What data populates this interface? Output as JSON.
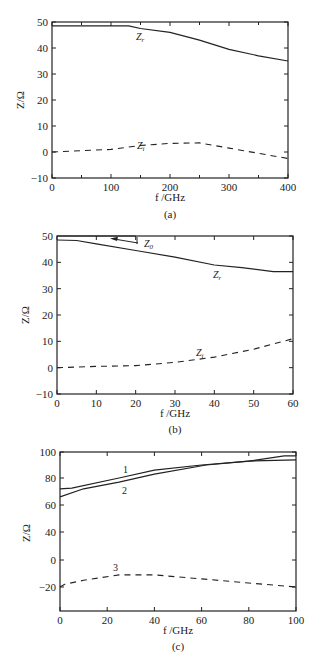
{
  "chart_data": [
    {
      "id": "a",
      "type": "line",
      "caption": "(a)",
      "title": "",
      "xlabel": "f /GHz",
      "ylabel": "Z/Ω",
      "xlim": [
        0,
        400
      ],
      "ylim": [
        -10,
        50
      ],
      "xticks": [
        0,
        100,
        200,
        300,
        400
      ],
      "yticks": [
        -10,
        0,
        10,
        20,
        30,
        40,
        50
      ],
      "xtick_labels": [
        "0",
        "100",
        "200",
        "300",
        "400"
      ],
      "ytick_labels": [
        "−10",
        "0",
        "10",
        "20",
        "30",
        "40",
        "50"
      ],
      "grid": false,
      "series": [
        {
          "name": "Zr",
          "label": "Zr",
          "style": "solid",
          "x": [
            0,
            50,
            100,
            130,
            150,
            200,
            250,
            300,
            350,
            400
          ],
          "y": [
            48.5,
            48.5,
            48.5,
            48.5,
            47.5,
            46,
            43,
            39.5,
            37,
            35
          ]
        },
        {
          "name": "Zi",
          "label": "Zi",
          "style": "dashed",
          "x": [
            0,
            50,
            100,
            150,
            200,
            250,
            300,
            350,
            400
          ],
          "y": [
            0,
            0.5,
            1,
            2.5,
            3.3,
            3.5,
            1.5,
            -0.5,
            -2.5
          ]
        }
      ]
    },
    {
      "id": "b",
      "type": "line",
      "caption": "(b)",
      "title": "",
      "xlabel": "f /GHz",
      "ylabel": "Z/Ω",
      "xlim": [
        0,
        60
      ],
      "ylim": [
        -10,
        50
      ],
      "xticks": [
        0,
        10,
        20,
        30,
        40,
        50,
        60
      ],
      "yticks": [
        -10,
        0,
        10,
        20,
        30,
        40,
        50
      ],
      "xtick_labels": [
        "0",
        "10",
        "20",
        "30",
        "40",
        "50",
        "60"
      ],
      "ytick_labels": [
        "−10",
        "0",
        "10",
        "20",
        "30",
        "40",
        "50"
      ],
      "grid": false,
      "annotations": [
        {
          "text": "Z0",
          "arrow_to": [
            14,
            50
          ]
        }
      ],
      "series": [
        {
          "name": "Z0",
          "label": "Z0",
          "style": "solid",
          "x": [
            1,
            20
          ],
          "y": [
            50,
            50
          ]
        },
        {
          "name": "Zr",
          "label": "Zr",
          "style": "solid",
          "x": [
            0,
            5,
            10,
            20,
            30,
            40,
            47,
            55,
            60
          ],
          "y": [
            48.5,
            48.3,
            47,
            44.5,
            42,
            39,
            38,
            36.5,
            36.5
          ]
        },
        {
          "name": "Zi",
          "label": "Zi",
          "style": "dashed",
          "x": [
            0,
            10,
            20,
            30,
            40,
            50,
            60
          ],
          "y": [
            0,
            0.5,
            0.8,
            2,
            4,
            7,
            11
          ]
        }
      ]
    },
    {
      "id": "c",
      "type": "line",
      "caption": "(c)",
      "title": "",
      "xlabel": "f /GHz",
      "ylabel": "Z/Ω",
      "xlim": [
        0,
        100
      ],
      "ylim_note": "tick labels printed as 100, 80, 60, 40, 0, −20 (non-uniform as printed)",
      "xticks": [
        0,
        20,
        40,
        60,
        80,
        100
      ],
      "xtick_labels": [
        "0",
        "20",
        "40",
        "60",
        "80",
        "100"
      ],
      "ytick_labels": [
        "100",
        "80",
        "60",
        "40",
        "0",
        "−20"
      ],
      "grid": false,
      "series": [
        {
          "name": "1",
          "label": "1",
          "style": "solid",
          "x": [
            0,
            5,
            25,
            40,
            60,
            80,
            95,
            100
          ],
          "y": [
            72,
            72.5,
            80,
            86,
            90,
            93,
            97,
            97
          ]
        },
        {
          "name": "2",
          "label": "2",
          "style": "solid",
          "x": [
            0,
            10,
            25,
            40,
            62,
            80,
            100
          ],
          "y": [
            66,
            72,
            77,
            83,
            90,
            93,
            94
          ]
        },
        {
          "name": "3",
          "label": "3",
          "style": "dashed",
          "x": [
            0,
            2,
            10,
            25,
            40,
            60,
            80,
            100
          ],
          "y": [
            -20,
            -18,
            -15,
            -11,
            -11,
            -14,
            -17,
            -20
          ]
        }
      ]
    }
  ]
}
